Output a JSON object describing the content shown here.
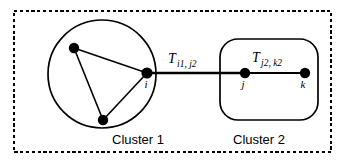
{
  "figure": {
    "name": "two-cluster-trust-diagram",
    "background_color": "#ffffff",
    "stroke_color": "#000000",
    "border": {
      "style": "dashed",
      "x": 14,
      "y": 11,
      "width": 317,
      "height": 141
    }
  },
  "clusters": [
    {
      "id": "cluster-1",
      "caption": "Cluster 1",
      "shape": "circle",
      "cx": 102,
      "cy": 74,
      "r": 54,
      "caption_x": 112,
      "caption_y": 144
    },
    {
      "id": "cluster-2",
      "caption": "Cluster 2",
      "shape": "rounded-rect",
      "x": 220,
      "y": 39,
      "width": 98,
      "height": 81,
      "rx": 18,
      "caption_x": 233,
      "caption_y": 144
    }
  ],
  "nodes": [
    {
      "id": "node-a",
      "label": "",
      "cx": 74,
      "cy": 48,
      "r": 5.2,
      "label_x": 0,
      "label_y": 0
    },
    {
      "id": "node-b",
      "label": "",
      "cx": 103,
      "cy": 120,
      "r": 5.2,
      "label_x": 0,
      "label_y": 0
    },
    {
      "id": "node-i",
      "label": "i",
      "cx": 147,
      "cy": 73,
      "r": 5.6,
      "label_x": 146,
      "label_y": 88
    },
    {
      "id": "node-j",
      "label": "j",
      "cx": 245,
      "cy": 73,
      "r": 5.2,
      "label_x": 243,
      "label_y": 88
    },
    {
      "id": "node-k",
      "label": "k",
      "cx": 305,
      "cy": 73,
      "r": 5.2,
      "label_x": 303,
      "label_y": 88
    }
  ],
  "edges": [
    {
      "id": "edge-a-i",
      "x1": 74,
      "y1": 48,
      "x2": 147,
      "y2": 73,
      "width": 1.6
    },
    {
      "id": "edge-a-b",
      "x1": 74,
      "y1": 48,
      "x2": 103,
      "y2": 120,
      "width": 1.6
    },
    {
      "id": "edge-b-i",
      "x1": 103,
      "y1": 120,
      "x2": 147,
      "y2": 73,
      "width": 1.6
    },
    {
      "id": "edge-i-j",
      "x1": 147,
      "y1": 73,
      "x2": 245,
      "y2": 73,
      "width": 2.6
    },
    {
      "id": "edge-j-k",
      "x1": 245,
      "y1": 73,
      "x2": 305,
      "y2": 73,
      "width": 2.0
    }
  ],
  "edge_labels": [
    {
      "id": "trust-label-i1-j2",
      "symbol": "T",
      "subscript": "i1, j2",
      "symbol_x": 168,
      "symbol_y": 63,
      "subscript_x": 177,
      "subscript_y": 67
    },
    {
      "id": "trust-label-j2-k2",
      "symbol": "T",
      "subscript": "j2, k2",
      "symbol_x": 252,
      "symbol_y": 62,
      "subscript_x": 261,
      "subscript_y": 66
    }
  ]
}
